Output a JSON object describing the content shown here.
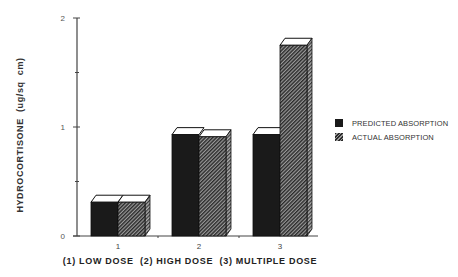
{
  "chart_data": {
    "type": "bar",
    "title": "",
    "xlabel": "(1) LOW DOSE  (2) HIGH DOSE  (3) MULTIPLE DOSE",
    "ylabel": "HYDROCORTISONE  (ug/sq  cm)",
    "categories": [
      "1",
      "2",
      "3"
    ],
    "category_meaning": [
      "LOW DOSE",
      "HIGH DOSE",
      "MULTIPLE DOSE"
    ],
    "series": [
      {
        "name": "PREDICTED ABSORPTION",
        "values": [
          0.31,
          0.93,
          0.93
        ],
        "color": "#1a1a1a",
        "pattern": "solid"
      },
      {
        "name": "ACTUAL ABSORPTION",
        "values": [
          0.31,
          0.91,
          1.75
        ],
        "color": "#555555",
        "pattern": "hatched"
      }
    ],
    "ylim": [
      0,
      2
    ],
    "yticks": [
      "0",
      "1",
      "2"
    ],
    "minor_yticks": [
      0.5,
      1.5
    ],
    "grid": false,
    "legend_position": "right",
    "style": "3d-bars"
  },
  "legend": {
    "items": [
      {
        "label": "PREDICTED ABSORPTION"
      },
      {
        "label": "ACTUAL ABSORPTION"
      }
    ]
  },
  "axis": {
    "ylabel": "HYDROCORTISONE  (ug/sq  cm)",
    "caption": "(1) LOW DOSE  (2) HIGH DOSE  (3) MULTIPLE DOSE"
  }
}
